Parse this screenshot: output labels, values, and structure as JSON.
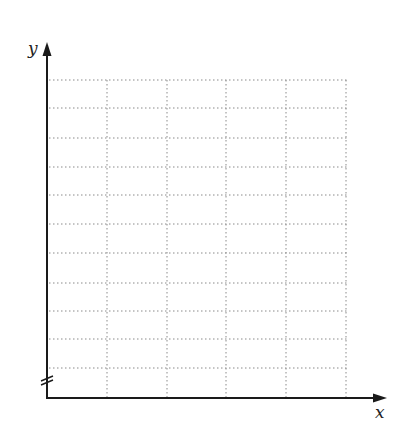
{
  "diagram": {
    "type": "blank_grid",
    "axes": {
      "x_label": "x",
      "y_label": "y",
      "y_axis_break": true
    },
    "grid": {
      "columns": 5,
      "rows": 10,
      "line_style": "dotted",
      "line_color": "#8a8a8a"
    },
    "axis_color": "#1a1a1a"
  }
}
